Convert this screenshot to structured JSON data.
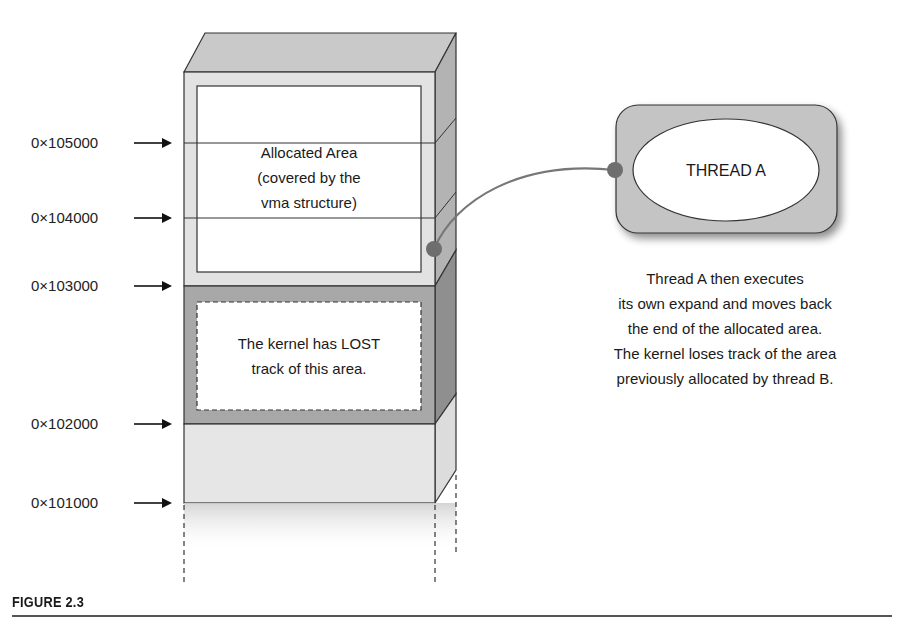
{
  "figure": {
    "caption": "FIGURE 2.3"
  },
  "addresses": [
    {
      "label": "0×105000",
      "y": 143
    },
    {
      "label": "0×104000",
      "y": 218
    },
    {
      "label": "0×103000",
      "y": 286
    },
    {
      "label": "0×102000",
      "y": 424
    },
    {
      "label": "0×101000",
      "y": 503
    }
  ],
  "memory_stack": {
    "allocated_area": {
      "line1": "Allocated Area",
      "line2": "(covered by the",
      "line3": "vma structure)"
    },
    "lost_area": {
      "line1": "The kernel has LOST",
      "line2": "track of this area."
    }
  },
  "thread": {
    "label": "THREAD A"
  },
  "description": {
    "line1": "Thread A then executes",
    "line2": "its own expand and moves back",
    "line3": "the end of the allocated area.",
    "line4": "The kernel loses track of the area",
    "line5": "previously allocated by thread B."
  },
  "colors": {
    "block_light": "#e6e6e6",
    "block_mid": "#d4d4d4",
    "block_dark": "#a9a9a9",
    "side_dark": "#9c9c9c",
    "top_face": "#c8c8c8",
    "connector": "#6e6e6e"
  }
}
